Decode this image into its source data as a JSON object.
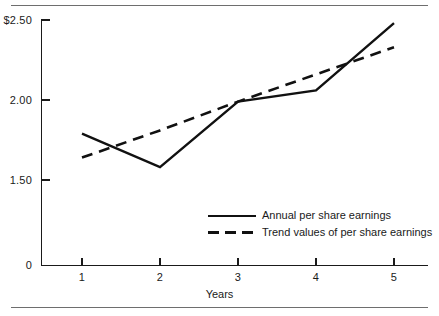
{
  "figure": {
    "has_top_rule": true,
    "has_bottom_rule": true,
    "rule_color": "#6e6e6e",
    "background": "#ffffff"
  },
  "axis_title_x": "Years",
  "ytick_labels": [
    "$2.50",
    "2.00",
    "1.50",
    "0"
  ],
  "xtick_labels": [
    "1",
    "2",
    "3",
    "4",
    "5"
  ],
  "legend": {
    "items": [
      {
        "label": "Annual per share earnings",
        "style": "solid",
        "color": "#111111"
      },
      {
        "label": "Trend values of per share earnings",
        "style": "dashed",
        "color": "#111111"
      }
    ]
  },
  "chart_data": {
    "type": "line",
    "title": "",
    "subtitle": "",
    "xlabel": "Years",
    "ylabel": "",
    "x": [
      1,
      2,
      3,
      4,
      5
    ],
    "categories": [
      "1",
      "2",
      "3",
      "4",
      "5"
    ],
    "series": [
      {
        "name": "Annual per share earnings",
        "style": "solid",
        "color": "#111111",
        "values": [
          1.79,
          1.58,
          1.99,
          2.06,
          2.48
        ]
      },
      {
        "name": "Trend values of per share earnings",
        "style": "dashed",
        "color": "#111111",
        "values": [
          1.64,
          1.81,
          1.99,
          2.16,
          2.33
        ]
      }
    ],
    "ylim": [
      0,
      2.5
    ],
    "xlim": [
      0.5,
      5.4
    ],
    "yticks": [
      2.5,
      2.0,
      1.5,
      0
    ],
    "ytick_labels": [
      "$2.50",
      "2.00",
      "1.50",
      "0"
    ],
    "xticks": [
      1,
      2,
      3,
      4,
      5
    ],
    "y_axis_break": true,
    "grid": false,
    "legend_position": "inside-lower-right",
    "currency": "$"
  }
}
